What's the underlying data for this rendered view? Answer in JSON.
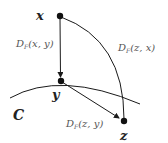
{
  "diagram": {
    "type": "geometric-projection",
    "points": {
      "x": {
        "label": "x"
      },
      "y": {
        "label": "y"
      },
      "z": {
        "label": "z"
      }
    },
    "set_label": "C",
    "edges": [
      {
        "from": "x",
        "to": "y",
        "label": "D_F(x, y)",
        "style": "arrow"
      },
      {
        "from": "y",
        "to": "z",
        "label": "D_F(z, y)",
        "style": "arrow"
      },
      {
        "from": "x",
        "to": "z",
        "label": "D_F(z, x)",
        "style": "arc"
      }
    ],
    "labels": {
      "dxy": "D",
      "dxy_sub": "F",
      "dxy_args": "(x, y)",
      "dzx": "D",
      "dzx_sub": "F",
      "dzx_args": "(z, x)",
      "dzy": "D",
      "dzy_sub": "F",
      "dzy_args": "(z, y)"
    },
    "colors": {
      "line": "#1a1a1a",
      "point": "#111111",
      "label": "#555555"
    }
  }
}
